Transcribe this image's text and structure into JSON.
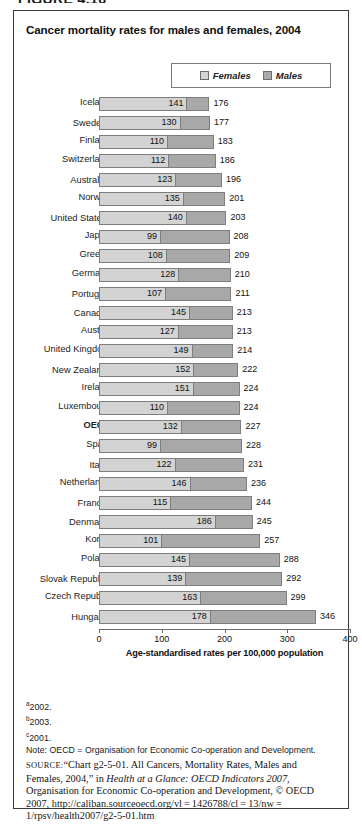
{
  "figure_caption_partial": "FIGURE 4.16",
  "chart_title": "Cancer mortality rates for males and females, 2004",
  "legend": {
    "items": [
      {
        "label": "Females",
        "color": "#d3d3d3",
        "icon": "square-swatch-icon"
      },
      {
        "label": "Males",
        "color": "#a8a8a8",
        "icon": "square-swatch-icon"
      }
    ]
  },
  "axis": {
    "title": "Age-standardised rates per 100,000 population",
    "ticks": [
      "0",
      "100",
      "200",
      "300",
      "400"
    ],
    "min": 0,
    "max": 400
  },
  "footnotes": [
    {
      "marker": "a",
      "text": "2002."
    },
    {
      "marker": "b",
      "text": "2003."
    },
    {
      "marker": "c",
      "text": "2001."
    }
  ],
  "note": "Note: OECD = Organisation for Economic Co-operation and Development.",
  "source": {
    "kicker": "source:",
    "part1": "“Chart g2-5-01. All Cancers, Mortality Rates, Males and Females, 2004,” in ",
    "italic": "Health at a Glance: OECD Indicators 2007",
    "part2": ", Organisation for Economic Co-operation and Development, © OECD 2007, http://caliban.sourceoecd.org/vl = 1426788/cl = 13/nw = 1/rpsv/health2007/g2-5-01.htm"
  },
  "chart_data": {
    "type": "bar",
    "orientation": "horizontal",
    "stacked": false,
    "title": "Cancer mortality rates for males and females, 2004",
    "xlabel": "Age-standardised rates per 100,000 population",
    "ylabel": "",
    "xlim": [
      0,
      400
    ],
    "xticks": [
      0,
      100,
      200,
      300,
      400
    ],
    "grid": false,
    "legend_position": "top-right",
    "series": [
      {
        "name": "Females",
        "color": "#d3d3d3"
      },
      {
        "name": "Males",
        "color": "#a8a8a8"
      }
    ],
    "categories": [
      "Iceland",
      "Sweden",
      "Finland",
      "Switzerland",
      "Australia",
      "Norway",
      "United States",
      "Japan",
      "Greece",
      "Germany",
      "Portugal",
      "Canada",
      "Austria",
      "United Kingdom",
      "New Zealand",
      "Ireland",
      "Luxembourg",
      "OECD",
      "Spain",
      "Italy",
      "Netherlands",
      "France",
      "Denmark",
      "Korea",
      "Poland",
      "Slovak Republic",
      "Czech Republic",
      "Hungary"
    ],
    "rows": [
      {
        "label": "Iceland",
        "footnote": "",
        "females": 141,
        "males": 176,
        "bold": false
      },
      {
        "label": "Sweden",
        "footnote": "a",
        "females": 130,
        "males": 177,
        "bold": false
      },
      {
        "label": "Finland",
        "footnote": "",
        "females": 110,
        "males": 183,
        "bold": false
      },
      {
        "label": "Switzerland",
        "footnote": "",
        "females": 112,
        "males": 186,
        "bold": false
      },
      {
        "label": "Australia",
        "footnote": "b",
        "females": 123,
        "males": 196,
        "bold": false
      },
      {
        "label": "Norway",
        "footnote": "",
        "females": 135,
        "males": 201,
        "bold": false
      },
      {
        "label": "United States",
        "footnote": "a",
        "females": 140,
        "males": 203,
        "bold": false
      },
      {
        "label": "Japan",
        "footnote": "",
        "females": 99,
        "males": 208,
        "bold": false
      },
      {
        "label": "Greece",
        "footnote": "",
        "females": 108,
        "males": 209,
        "bold": false
      },
      {
        "label": "Germany",
        "footnote": "",
        "females": 128,
        "males": 210,
        "bold": false
      },
      {
        "label": "Portugal",
        "footnote": "b",
        "females": 107,
        "males": 211,
        "bold": false
      },
      {
        "label": "Canada",
        "footnote": "a",
        "females": 145,
        "males": 213,
        "bold": false
      },
      {
        "label": "Austria",
        "footnote": "",
        "females": 127,
        "males": 213,
        "bold": false
      },
      {
        "label": "United Kingdom",
        "footnote": "",
        "females": 149,
        "males": 214,
        "bold": false
      },
      {
        "label": "New Zealand",
        "footnote": "c",
        "females": 152,
        "males": 222,
        "bold": false
      },
      {
        "label": "Ireland",
        "footnote": "",
        "females": 151,
        "males": 224,
        "bold": false
      },
      {
        "label": "Luxembourg",
        "footnote": "",
        "females": 110,
        "males": 224,
        "bold": false
      },
      {
        "label": "OECD",
        "footnote": "",
        "females": 132,
        "males": 227,
        "bold": true
      },
      {
        "label": "Spain",
        "footnote": "",
        "females": 99,
        "males": 228,
        "bold": false
      },
      {
        "label": "Italy",
        "footnote": "a",
        "females": 122,
        "males": 231,
        "bold": false
      },
      {
        "label": "Netherlands",
        "footnote": "",
        "females": 146,
        "males": 236,
        "bold": false
      },
      {
        "label": "France",
        "footnote": "b",
        "females": 115,
        "males": 244,
        "bold": false
      },
      {
        "label": "Denmark",
        "footnote": "c",
        "females": 186,
        "males": 245,
        "bold": false
      },
      {
        "label": "Korea",
        "footnote": "",
        "females": 101,
        "males": 257,
        "bold": false
      },
      {
        "label": "Poland",
        "footnote": "",
        "females": 145,
        "males": 288,
        "bold": false
      },
      {
        "label": "Slovak Republic",
        "footnote": "a",
        "females": 139,
        "males": 292,
        "bold": false
      },
      {
        "label": "Czech Republic",
        "footnote": "",
        "females": 163,
        "males": 299,
        "bold": false
      },
      {
        "label": "Hungary",
        "footnote": "b",
        "females": 178,
        "males": 346,
        "bold": false
      }
    ]
  }
}
